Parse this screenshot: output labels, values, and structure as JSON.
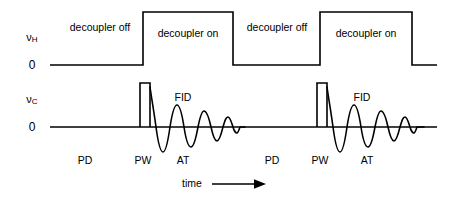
{
  "figure": {
    "type": "nmr-pulse-sequence-diagram",
    "width": 449,
    "height": 199,
    "stroke_color": "#000000",
    "background_color": "#ffffff"
  },
  "channels": {
    "proton": {
      "axis_label_main": "ν",
      "axis_label_sub": "H",
      "zero_label": "0",
      "baseline_y": 65,
      "high_y": 12,
      "segments": [
        {
          "label": "decoupler off",
          "state": "off",
          "x_start": 50,
          "x_end": 143,
          "center_x": 100
        },
        {
          "label": "decoupler on",
          "state": "on",
          "x_start": 143,
          "x_end": 233,
          "center_x": 188
        },
        {
          "label": "decoupler off",
          "state": "off",
          "x_start": 233,
          "x_end": 320,
          "center_x": 277
        },
        {
          "label": "decoupler on",
          "state": "on",
          "x_start": 320,
          "x_end": 412,
          "center_x": 366
        }
      ]
    },
    "carbon": {
      "axis_label_main": "ν",
      "axis_label_sub": "C",
      "zero_label": "0",
      "baseline_y": 127,
      "pulse_top_y": 83,
      "pulses": [
        {
          "name": "PW",
          "x_start": 140,
          "x_end": 150
        },
        {
          "name": "PW",
          "x_start": 317,
          "x_end": 327
        }
      ],
      "fids": [
        {
          "label": "FID",
          "label_x": 183,
          "label_y": 97,
          "start_x": 150,
          "end_x": 238
        },
        {
          "label": "FID",
          "label_x": 362,
          "label_y": 97,
          "start_x": 327,
          "end_x": 415
        }
      ]
    }
  },
  "phase_labels": [
    {
      "text": "PD",
      "x": 85,
      "y": 161
    },
    {
      "text": "PW",
      "x": 143,
      "y": 161
    },
    {
      "text": "AT",
      "x": 183,
      "y": 161
    },
    {
      "text": "PD",
      "x": 272,
      "y": 161
    },
    {
      "text": "PW",
      "x": 320,
      "y": 161
    },
    {
      "text": "AT",
      "x": 367,
      "y": 161
    }
  ],
  "time_axis": {
    "label": "time",
    "label_x": 192,
    "label_y": 179,
    "arrow_x_start": 212,
    "arrow_x_end": 263,
    "arrow_y": 184
  }
}
